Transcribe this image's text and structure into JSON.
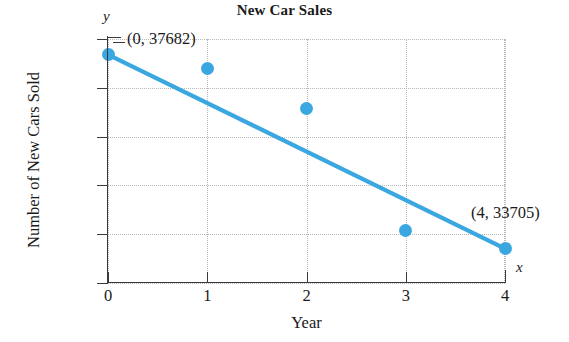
{
  "chart_data": {
    "type": "scatter",
    "title": "New Car Sales",
    "xlabel": "Year",
    "ylabel": "Number of New Cars Sold",
    "x_axis_letter": "x",
    "y_axis_letter": "y",
    "xlim": [
      0,
      4
    ],
    "ylim": [
      33000,
      38000
    ],
    "grid": true,
    "legend": "none",
    "x_ticks": [
      {
        "value": 0,
        "label": "0"
      },
      {
        "value": 1,
        "label": "1"
      },
      {
        "value": 2,
        "label": "2"
      },
      {
        "value": 3,
        "label": "3"
      },
      {
        "value": 4,
        "label": "4"
      }
    ],
    "y_ticks": [
      {
        "value": 38000,
        "label": "38,000"
      },
      {
        "value": 37000,
        "label": "37,000"
      },
      {
        "value": 36000,
        "label": "36,000"
      },
      {
        "value": 35000,
        "label": "35,000"
      },
      {
        "value": 34000,
        "label": "34,000"
      },
      {
        "value": 33000,
        "label": "33,000"
      }
    ],
    "x": [
      0,
      1,
      2,
      3,
      4
    ],
    "values": [
      37682,
      37400,
      36570,
      34080,
      33705
    ],
    "series": [
      {
        "name": "Number of New Cars Sold",
        "type": "scatter",
        "color": "#3ba7e0",
        "x": [
          0,
          1,
          2,
          3,
          4
        ],
        "values": [
          37682,
          37400,
          36570,
          34080,
          33705
        ]
      },
      {
        "name": "Trend line",
        "type": "line",
        "color": "#3ba7e0",
        "x": [
          0,
          4
        ],
        "values": [
          37682,
          33705
        ]
      }
    ],
    "annotations": [
      {
        "text": "(0, 37682)",
        "x": 0,
        "y": 37682
      },
      {
        "text": "(4, 33705)",
        "x": 4,
        "y": 33705
      }
    ]
  },
  "colors": {
    "marker": "#3ba7e0",
    "line": "#3ba7e0",
    "axis": "#3a3a3a",
    "grid": "#b9b9b9",
    "background": "#ffffff"
  }
}
